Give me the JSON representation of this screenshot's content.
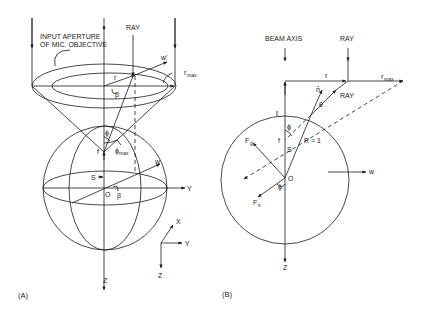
{
  "panel_a": {
    "caption": "(A)",
    "aperture_label_line1": "INPUT APERTURE",
    "aperture_label_line2": "OF MIC. OBJECTIVE",
    "ray_label": "RAY",
    "labels": {
      "w_prime": "w'",
      "r": "r",
      "r_max": "r",
      "r_max_sub": "max",
      "beta_top": "β",
      "phi": "ϕ",
      "phi_max": "ϕ",
      "phi_max_sub": "max",
      "f": "f",
      "S": "S",
      "O": "O",
      "beta_bottom": "β",
      "w": "w",
      "Y_axis": "Y",
      "Z_axis": "Z",
      "X_small": "X",
      "Y_small": "Y",
      "Z_small": "Z"
    }
  },
  "panel_b": {
    "caption": "(B)",
    "beam_axis_label": "BEAM AXIS",
    "ray_label_top": "RAY",
    "ray_label_refracted": "RAY",
    "labels": {
      "r": "r",
      "r_max": "r",
      "r_max_sub": "max",
      "n_hat": "n̂",
      "theta": "θ",
      "ell": "ℓ",
      "phi_top": "ϕ",
      "f": "f",
      "S": "S",
      "R": "R = 1",
      "F_g": "F",
      "F_g_sub": "g",
      "O": "O",
      "phi_bottom": "ϕ",
      "F_s": "F",
      "F_s_sub": "s",
      "w": "w",
      "Z_axis": "Z"
    }
  }
}
